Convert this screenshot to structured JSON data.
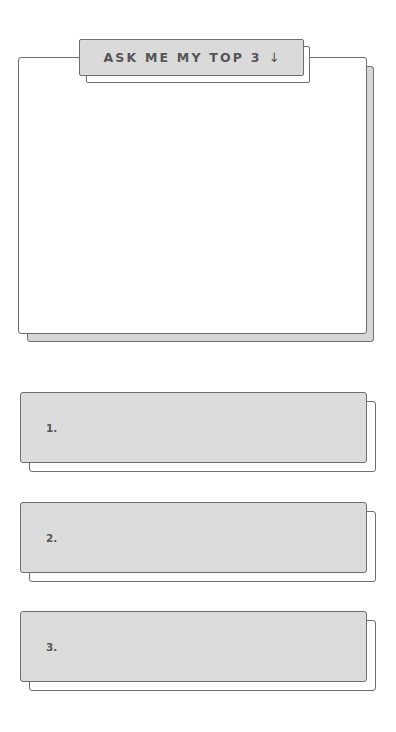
{
  "header": {
    "tab_label": "ASK ME MY TOP 3",
    "tab_icon": "arrow-down-icon",
    "tab_icon_glyph": "↓"
  },
  "main_card": {
    "content": ""
  },
  "list": {
    "items": [
      {
        "label": "1."
      },
      {
        "label": "2."
      },
      {
        "label": "3."
      }
    ]
  },
  "colors": {
    "background": "#ffffff",
    "card_fill": "#dcdcdc",
    "shadow_fill": "#d6d6d6",
    "border": "#6e6e6e",
    "text": "#555555"
  }
}
